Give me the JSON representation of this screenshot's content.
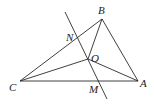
{
  "diagram": {
    "points": {
      "A": {
        "label": "A",
        "x": 138,
        "y": 81,
        "lx": 140,
        "ly": 87
      },
      "B": {
        "label": "B",
        "x": 102,
        "y": 19,
        "lx": 98,
        "ly": 14
      },
      "C": {
        "label": "C",
        "x": 20,
        "y": 81,
        "lx": 9,
        "ly": 91
      },
      "O": {
        "label": "O",
        "x": 88,
        "y": 59,
        "lx": 91,
        "ly": 62
      },
      "N": {
        "label": "N",
        "x": 77,
        "y": 37,
        "lx": 66,
        "ly": 41
      },
      "M": {
        "label": "M",
        "x": 98,
        "y": 81,
        "lx": 89,
        "ly": 93
      }
    },
    "segments": [
      [
        "A",
        "B"
      ],
      [
        "B",
        "C"
      ],
      [
        "C",
        "A"
      ],
      [
        "O",
        "A"
      ],
      [
        "O",
        "B"
      ],
      [
        "O",
        "C"
      ]
    ],
    "perpendicular_line": {
      "x1": 65,
      "y1": 12,
      "x2": 107,
      "y2": 99
    }
  }
}
